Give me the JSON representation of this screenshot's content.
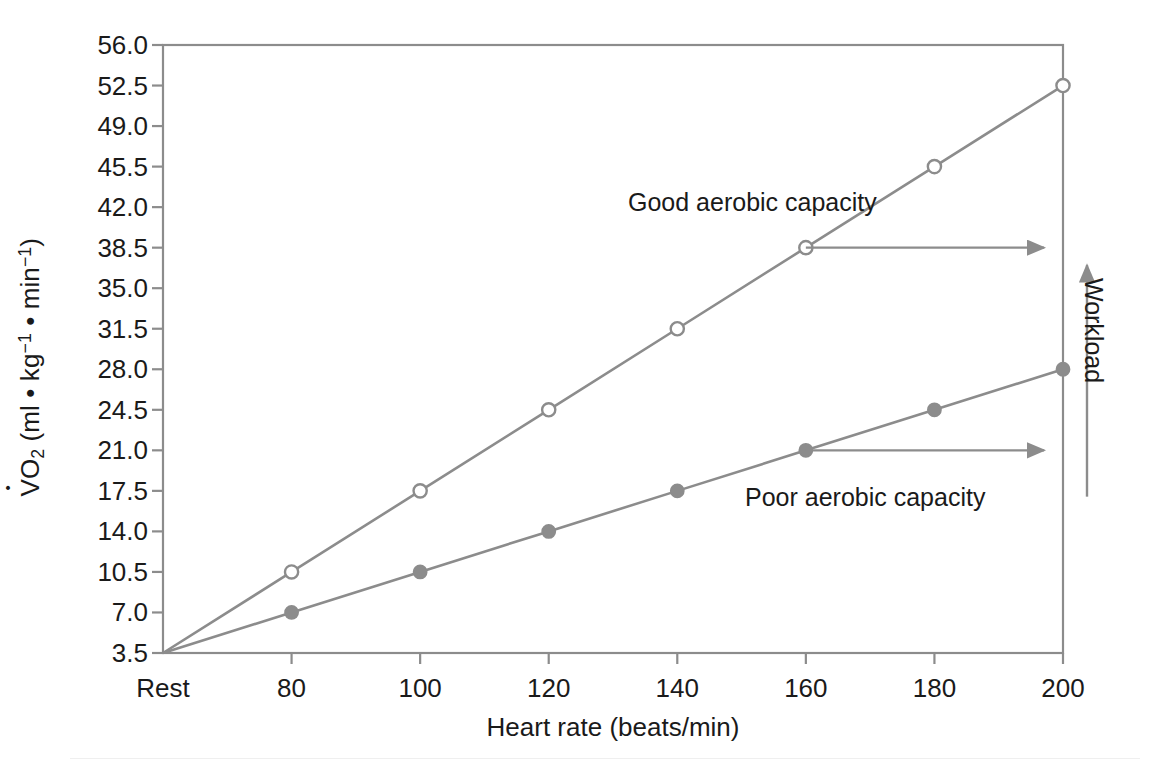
{
  "chart_data": {
    "type": "line",
    "title": "",
    "xlabel": "Heart rate (beats/min)",
    "ylabel": "VO2 (ml • kg-1 • min-1)",
    "x_tick_labels": [
      "Rest",
      "80",
      "100",
      "120",
      "140",
      "160",
      "180",
      "200"
    ],
    "x_values": [
      60,
      80,
      100,
      120,
      140,
      160,
      180,
      200
    ],
    "xlim": [
      60,
      200
    ],
    "y_tick_labels": [
      "3.5",
      "7.0",
      "10.5",
      "14.0",
      "17.5",
      "21.0",
      "24.5",
      "28.0",
      "31.5",
      "35.0",
      "38.5",
      "42.0",
      "45.5",
      "49.0",
      "52.5",
      "56.0"
    ],
    "y_values": [
      3.5,
      7.0,
      10.5,
      14.0,
      17.5,
      21.0,
      24.5,
      28.0,
      31.5,
      35.0,
      38.5,
      42.0,
      45.5,
      49.0,
      52.5,
      56.0
    ],
    "ylim": [
      3.5,
      56.0
    ],
    "grid": false,
    "legend": "none",
    "series": [
      {
        "name": "Good aerobic capacity",
        "marker": "open-circle",
        "color": "#8c8c8c",
        "x": [
          60,
          80,
          100,
          120,
          140,
          160,
          180,
          200
        ],
        "values": [
          3.5,
          10.5,
          17.5,
          24.5,
          31.5,
          38.5,
          45.5,
          52.5
        ],
        "marker_at_rest": false
      },
      {
        "name": "Poor aerobic capacity",
        "marker": "filled-circle",
        "color": "#8c8c8c",
        "x": [
          60,
          80,
          100,
          120,
          140,
          160,
          180,
          200
        ],
        "values": [
          3.5,
          7.0,
          10.5,
          14.0,
          17.5,
          21.0,
          24.5,
          28.0
        ],
        "marker_at_rest": false
      }
    ],
    "annotations": [
      {
        "name": "good-aerobic-capacity",
        "text": "Good aerobic capacity"
      },
      {
        "name": "poor-aerobic-capacity",
        "text": "Poor aerobic capacity"
      },
      {
        "name": "workload",
        "text": "Workload"
      }
    ],
    "arrows": [
      {
        "name": "good-trend-arrow",
        "direction": "right",
        "x_from": 160,
        "x_to": 198,
        "y": 38.5
      },
      {
        "name": "poor-trend-arrow",
        "direction": "right",
        "x_from": 160,
        "x_to": 198,
        "y": 21.0
      },
      {
        "name": "workload-arrow",
        "direction": "up",
        "y_from": 17.0,
        "y_to": 37.5
      }
    ],
    "colors": {
      "line": "#8c8c8c",
      "axis": "#8c8c8c",
      "marker_fill_open": "#ffffff",
      "marker_fill_closed": "#8c8c8c",
      "text": "#1a1a1a",
      "background": "#ffffff"
    }
  },
  "axes": {
    "x_axis_title": "Heart rate (beats/min)",
    "y_axis_title_parts": {
      "v": "V",
      "o": "O",
      "two": "2",
      "open": " (ml • kg",
      "exp1": "−1",
      "mid": " • min",
      "exp2": "−1",
      "close": ")"
    }
  },
  "labels": {
    "good": "Good aerobic capacity",
    "poor": "Poor aerobic capacity",
    "workload": "Workload"
  }
}
